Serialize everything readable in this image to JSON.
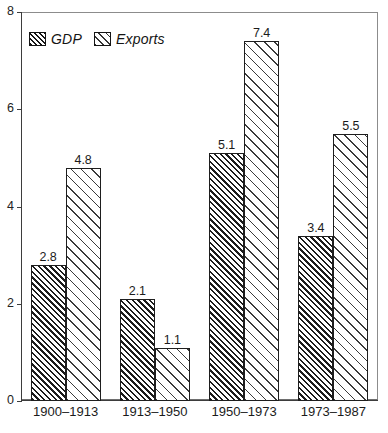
{
  "chart_data": {
    "type": "bar",
    "title": "",
    "subtitle": "",
    "xlabel": "",
    "ylabel": "",
    "categories": [
      "1900–1913",
      "1913–1950",
      "1950–1973",
      "1973–1987"
    ],
    "series": [
      {
        "name": "GDP",
        "values": [
          2.8,
          2.1,
          5.1,
          3.4
        ],
        "pattern": "dense-diagonal-hatch",
        "color": "#1c1c1c"
      },
      {
        "name": "Exports",
        "values": [
          4.8,
          1.1,
          7.4,
          5.5
        ],
        "pattern": "sparse-diagonal-hatch",
        "color": "#3a3a3a"
      }
    ],
    "ylim": [
      0,
      8
    ],
    "yticks": [
      0,
      2,
      4,
      6,
      8
    ],
    "ytick_labels": [
      "0",
      "2",
      "4",
      "6",
      "8"
    ],
    "grid": false,
    "legend_position": "top-left",
    "data_labels": true
  },
  "legend": {
    "entries": [
      {
        "label": "GDP",
        "swatch": "dense-hatch-swatch"
      },
      {
        "label": "Exports",
        "swatch": "sparse-hatch-swatch"
      }
    ]
  },
  "axis": {
    "y_ticks": [
      "8",
      "6",
      "4",
      "2",
      "0"
    ]
  }
}
